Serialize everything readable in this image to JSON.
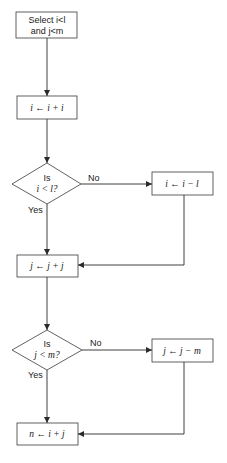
{
  "flowchart": {
    "start": {
      "line1": "Select i<l",
      "line2": "and j<m"
    },
    "step_i_double": "i ← i + i",
    "decision_i": {
      "line1": "Is",
      "line2": "i < l?",
      "yes": "Yes",
      "no": "No"
    },
    "step_i_subtract": "i ← i − l",
    "step_j_double": "j ← j + j",
    "decision_j": {
      "line1": "Is",
      "line2": "j < m?",
      "yes": "Yes",
      "no": "No"
    },
    "step_j_subtract": "j ← j − m",
    "result": "n ← i + j"
  },
  "colors": {
    "stroke": "#2a2a2a",
    "background": "#ffffff",
    "text": "#1a1a1a"
  }
}
